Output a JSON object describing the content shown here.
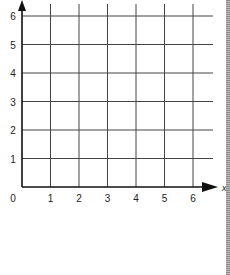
{
  "chart_data": {
    "type": "grid",
    "title": "",
    "xlabel": "x",
    "ylabel": "",
    "xlim": [
      0,
      6
    ],
    "ylim": [
      0,
      6
    ],
    "x_ticks": [
      "1",
      "2",
      "3",
      "4",
      "5",
      "6"
    ],
    "y_ticks": [
      "1",
      "2",
      "3",
      "4",
      "5",
      "6"
    ],
    "origin_label": "0",
    "grid": true,
    "series": []
  },
  "colors": {
    "axis": "#111111",
    "grid": "#444444",
    "label": "#222222",
    "background": "#ffffff"
  }
}
